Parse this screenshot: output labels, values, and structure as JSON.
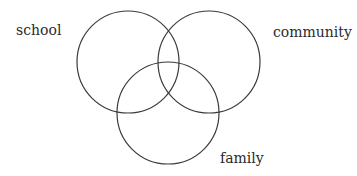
{
  "diagram": {
    "type": "venn",
    "stroke_color": "#3a3a3a",
    "text_color": "#2a2a2a",
    "background": "#ffffff",
    "sets": [
      {
        "id": "school",
        "label": "school",
        "cx": 128,
        "cy": 62,
        "r": 51,
        "label_x": 16,
        "label_y": 35
      },
      {
        "id": "community",
        "label": "community",
        "cx": 209,
        "cy": 62,
        "r": 51,
        "label_x": 273,
        "label_y": 37
      },
      {
        "id": "family",
        "label": "family",
        "cx": 168,
        "cy": 113,
        "r": 51,
        "label_x": 220,
        "label_y": 163
      }
    ]
  }
}
